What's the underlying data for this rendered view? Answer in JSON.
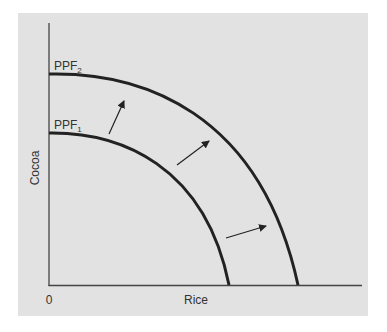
{
  "diagram": {
    "type": "production-possibilities-frontier",
    "background_color": "#e2e2e2",
    "curve_color": "#222222",
    "axis_color": "#444444",
    "y_axis_label": "Cocoa",
    "x_axis_label": "Rice",
    "origin_label": "0",
    "curves": [
      {
        "name": "PPF",
        "subscript": "1",
        "label": "PPF1"
      },
      {
        "name": "PPF",
        "subscript": "2",
        "label": "PPF2"
      }
    ],
    "arrows_count": 3,
    "arrows_meaning": "outward shift from PPF1 to PPF2"
  }
}
